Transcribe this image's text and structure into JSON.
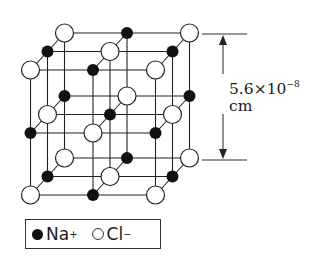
{
  "figure": {
    "type": "crystal-lattice"
  },
  "dimension": {
    "value": "5.6",
    "times": "×",
    "base": "10",
    "exponent": "−8",
    "unit": "cm"
  },
  "legend": {
    "items": [
      {
        "symbol": "filled-circle",
        "label": "Na",
        "charge": "+"
      },
      {
        "symbol": "open-circle",
        "label": "Cl",
        "charge": "−"
      }
    ]
  },
  "lattice": {
    "layers": [
      {
        "name": "top",
        "rows": [
          [
            "Cl",
            "Na",
            "Cl"
          ],
          [
            "Na",
            "Cl",
            "Na"
          ],
          [
            "Cl",
            "Na",
            "Cl"
          ]
        ]
      },
      {
        "name": "middle",
        "rows": [
          [
            "Na",
            "Cl",
            "Na"
          ],
          [
            "Cl",
            "Na",
            "Cl"
          ],
          [
            "Na",
            "Cl",
            "Na"
          ]
        ]
      },
      {
        "name": "bottom",
        "rows": [
          [
            "Cl",
            "Na",
            "Cl"
          ],
          [
            "Na",
            "Cl",
            "Na"
          ],
          [
            "Cl",
            "Na",
            "Cl"
          ]
        ]
      }
    ],
    "colors": {
      "na_fill": "#111111",
      "cl_fill": "#ffffff",
      "line": "#222222"
    }
  }
}
